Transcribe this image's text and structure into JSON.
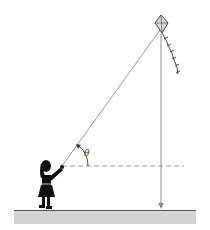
{
  "diagram": {
    "angle_label": "θ",
    "elements": [
      "kite",
      "kite-tail",
      "kite-string",
      "girl",
      "horizontal-reference-line",
      "vertical-line",
      "ground"
    ],
    "colors": {
      "line": "#8a8a8a",
      "silhouette": "#111111",
      "ground": "#d4d4d4",
      "ground_edge": "#555555",
      "kite_fill": "#d8d8d8",
      "kite_stroke": "#444444"
    }
  }
}
